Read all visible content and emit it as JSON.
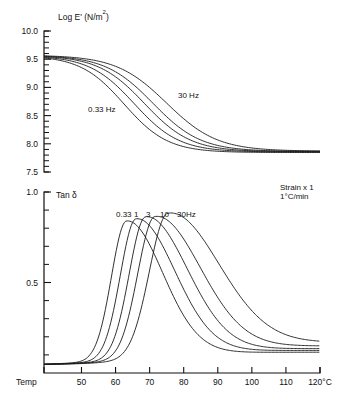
{
  "chart_data": {
    "type": "line",
    "title": "",
    "xlabel": "Temp",
    "x_axis_unit": "120°C",
    "xlim": [
      39,
      120
    ],
    "x_ticks": [
      50,
      60,
      70,
      80,
      90,
      100,
      110,
      120
    ],
    "x_tick_labels": [
      "50",
      "60",
      "70",
      "80",
      "90",
      "100",
      "110",
      "120°C"
    ],
    "annotations": [
      {
        "name": "strain-note",
        "text": "Strain x 1"
      },
      {
        "name": "rate-note",
        "text": "1°C/min"
      }
    ],
    "panels": [
      {
        "id": "modulus",
        "ylabel": "Log E' (N/m2)",
        "ylabel_base": "Log E' (N/m",
        "ylabel_sup": "2",
        "ylabel_tail": ")",
        "ylim": [
          7.5,
          10.0
        ],
        "y_ticks": [
          10.0,
          9.5,
          9.0,
          8.5,
          8.0,
          7.5
        ],
        "y_tick_labels": [
          "10.0",
          "9.5",
          "9.0",
          "8.5",
          "8.0",
          "7.5"
        ],
        "y_minor_step": 0.1,
        "curve_labels": [
          {
            "name": "low-frequency-label",
            "text": "0.33 Hz"
          },
          {
            "name": "high-frequency-label",
            "text": "30 Hz"
          }
        ],
        "series": [
          {
            "name": "0.33 Hz",
            "plateau_high": 9.565,
            "plateau_low": 7.845,
            "midpoint": 62.5,
            "width": 6.4
          },
          {
            "name": "1 Hz",
            "plateau_high": 9.565,
            "plateau_low": 7.855,
            "midpoint": 65.5,
            "width": 6.6
          },
          {
            "name": "3 Hz",
            "plateau_high": 9.568,
            "plateau_low": 7.86,
            "midpoint": 68.5,
            "width": 6.8
          },
          {
            "name": "10 Hz",
            "plateau_high": 9.57,
            "plateau_low": 7.865,
            "midpoint": 71.0,
            "width": 7.0
          },
          {
            "name": "30 Hz",
            "plateau_high": 9.572,
            "plateau_low": 7.87,
            "midpoint": 75.0,
            "width": 7.4
          }
        ]
      },
      {
        "id": "tandelta",
        "ylabel": "Tan δ",
        "ylim": [
          0.0,
          1.0
        ],
        "y_ticks": [
          1.0,
          0.5
        ],
        "y_tick_labels": [
          "1.0",
          "0.5"
        ],
        "y_minor_step": 0.1,
        "frequency_labels": [
          "0.33",
          "1",
          "3",
          "10",
          "30Hz"
        ],
        "series": [
          {
            "name": "0.33 Hz",
            "peak_temp": 63.2,
            "peak_value": 0.805,
            "width_left": 4.4,
            "width_right": 10.5,
            "baseline": 0.045,
            "tail": 0.115
          },
          {
            "name": "1 Hz",
            "peak_temp": 66.0,
            "peak_value": 0.812,
            "width_left": 4.6,
            "width_right": 11.2,
            "baseline": 0.045,
            "tail": 0.125
          },
          {
            "name": "3 Hz",
            "peak_temp": 68.8,
            "peak_value": 0.818,
            "width_left": 4.8,
            "width_right": 12.0,
            "baseline": 0.045,
            "tail": 0.135
          },
          {
            "name": "10 Hz",
            "peak_temp": 71.5,
            "peak_value": 0.812,
            "width_left": 5.0,
            "width_right": 13.0,
            "baseline": 0.045,
            "tail": 0.15
          },
          {
            "name": "30 Hz",
            "peak_temp": 75.3,
            "peak_value": 0.82,
            "width_left": 5.4,
            "width_right": 14.5,
            "baseline": 0.045,
            "tail": 0.17
          }
        ]
      }
    ]
  }
}
